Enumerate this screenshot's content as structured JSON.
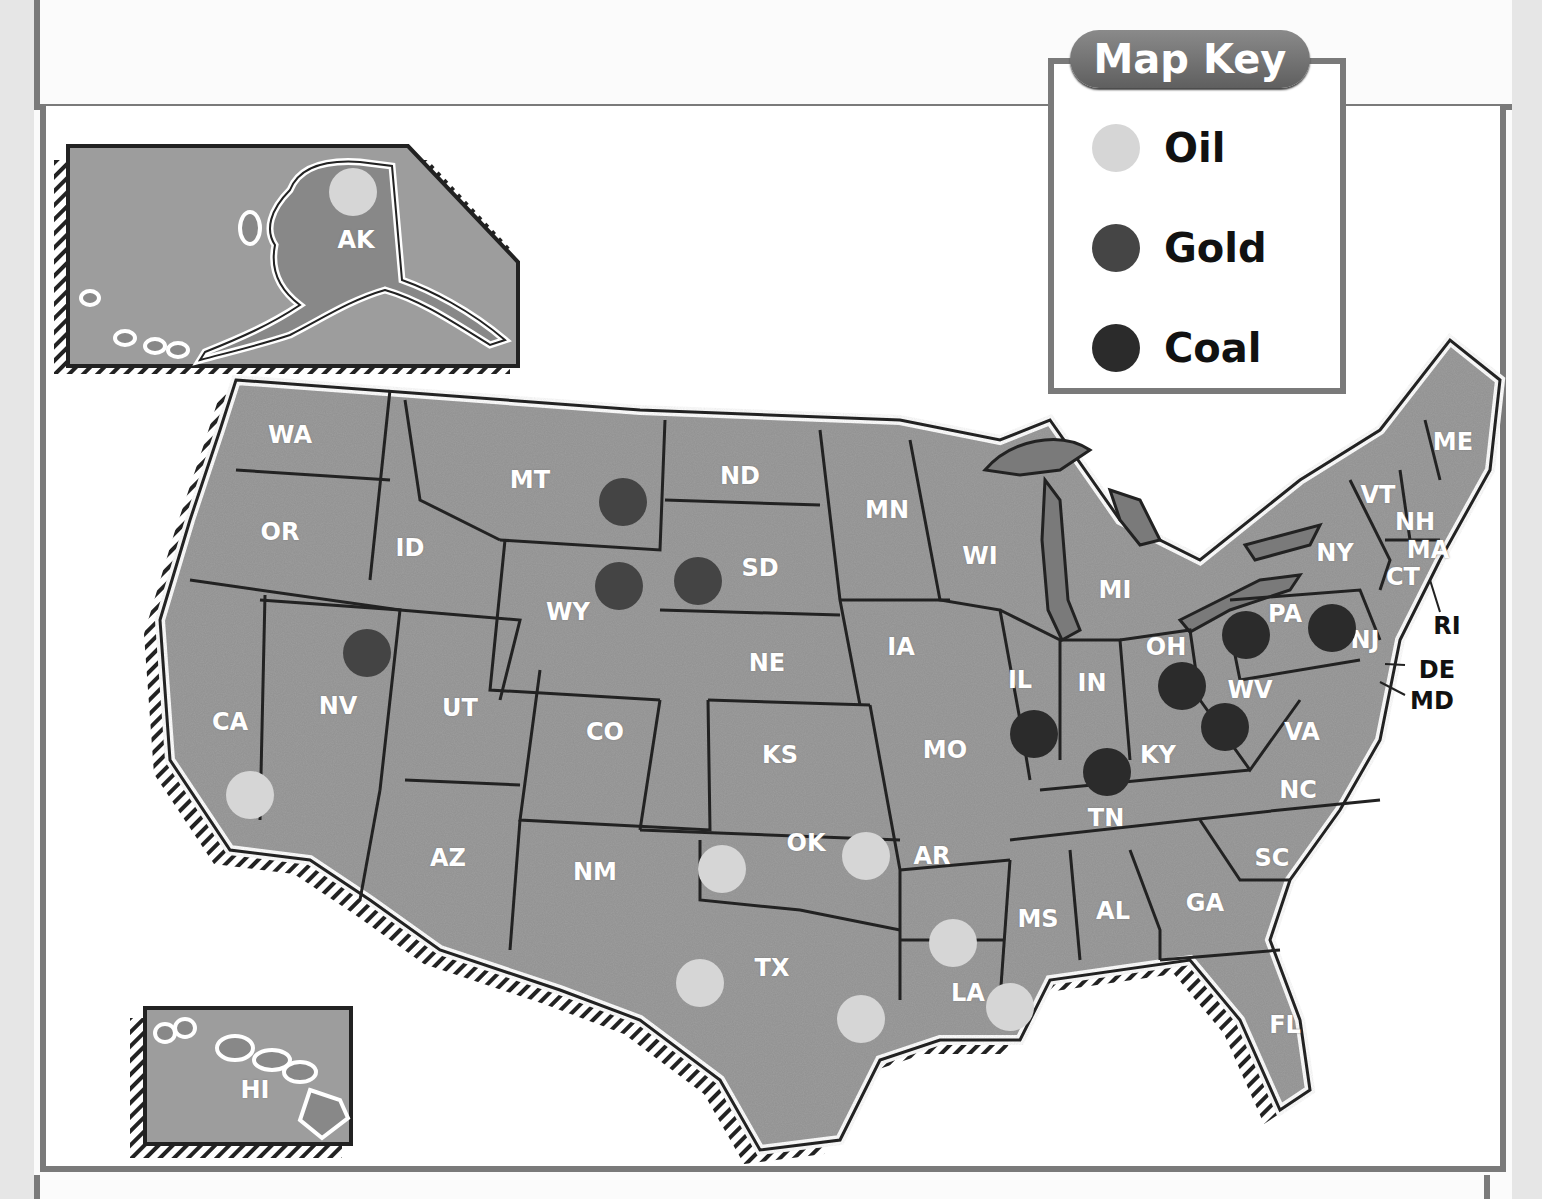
{
  "map": {
    "title": "Map Key",
    "colors": {
      "land": "#9a9a9a",
      "land_dark": "#7f7f7f",
      "border": "#2a2a2a",
      "coast": "#ffffff",
      "water": "#ffffff",
      "frame": "#7a7a7a",
      "oil": "#d6d6d6",
      "gold": "#444444",
      "coal": "#2b2b2b"
    },
    "legend": [
      {
        "id": "oil",
        "label": "Oil",
        "color": "#d6d6d6"
      },
      {
        "id": "gold",
        "label": "Gold",
        "color": "#454545"
      },
      {
        "id": "coal",
        "label": "Coal",
        "color": "#2b2b2b"
      }
    ],
    "states": [
      {
        "abbr": "AK",
        "x": 356,
        "y": 240
      },
      {
        "abbr": "HI",
        "x": 255,
        "y": 1090
      },
      {
        "abbr": "WA",
        "x": 290,
        "y": 435
      },
      {
        "abbr": "OR",
        "x": 280,
        "y": 532
      },
      {
        "abbr": "CA",
        "x": 230,
        "y": 722
      },
      {
        "abbr": "ID",
        "x": 410,
        "y": 548
      },
      {
        "abbr": "NV",
        "x": 338,
        "y": 706
      },
      {
        "abbr": "MT",
        "x": 530,
        "y": 480
      },
      {
        "abbr": "WY",
        "x": 568,
        "y": 612
      },
      {
        "abbr": "UT",
        "x": 460,
        "y": 708
      },
      {
        "abbr": "AZ",
        "x": 448,
        "y": 858
      },
      {
        "abbr": "CO",
        "x": 605,
        "y": 732
      },
      {
        "abbr": "NM",
        "x": 595,
        "y": 872
      },
      {
        "abbr": "ND",
        "x": 740,
        "y": 476
      },
      {
        "abbr": "SD",
        "x": 760,
        "y": 568
      },
      {
        "abbr": "NE",
        "x": 767,
        "y": 663
      },
      {
        "abbr": "KS",
        "x": 780,
        "y": 755
      },
      {
        "abbr": "OK",
        "x": 806,
        "y": 843
      },
      {
        "abbr": "TX",
        "x": 772,
        "y": 968
      },
      {
        "abbr": "MN",
        "x": 887,
        "y": 510
      },
      {
        "abbr": "IA",
        "x": 901,
        "y": 647
      },
      {
        "abbr": "MO",
        "x": 945,
        "y": 750
      },
      {
        "abbr": "AR",
        "x": 932,
        "y": 856
      },
      {
        "abbr": "LA",
        "x": 968,
        "y": 993
      },
      {
        "abbr": "WI",
        "x": 980,
        "y": 556
      },
      {
        "abbr": "IL",
        "x": 1020,
        "y": 680
      },
      {
        "abbr": "MI",
        "x": 1115,
        "y": 590
      },
      {
        "abbr": "IN",
        "x": 1092,
        "y": 683
      },
      {
        "abbr": "OH",
        "x": 1166,
        "y": 647
      },
      {
        "abbr": "KY",
        "x": 1158,
        "y": 755
      },
      {
        "abbr": "TN",
        "x": 1106,
        "y": 818
      },
      {
        "abbr": "MS",
        "x": 1038,
        "y": 919
      },
      {
        "abbr": "AL",
        "x": 1113,
        "y": 911
      },
      {
        "abbr": "GA",
        "x": 1205,
        "y": 903
      },
      {
        "abbr": "FL",
        "x": 1285,
        "y": 1025
      },
      {
        "abbr": "SC",
        "x": 1272,
        "y": 858
      },
      {
        "abbr": "NC",
        "x": 1298,
        "y": 790
      },
      {
        "abbr": "VA",
        "x": 1302,
        "y": 732
      },
      {
        "abbr": "WV",
        "x": 1250,
        "y": 690
      },
      {
        "abbr": "PA",
        "x": 1285,
        "y": 614
      },
      {
        "abbr": "NY",
        "x": 1335,
        "y": 553
      },
      {
        "abbr": "NJ",
        "x": 1365,
        "y": 640
      },
      {
        "abbr": "VT",
        "x": 1378,
        "y": 495
      },
      {
        "abbr": "NH",
        "x": 1415,
        "y": 522
      },
      {
        "abbr": "MA",
        "x": 1428,
        "y": 550
      },
      {
        "abbr": "CT",
        "x": 1403,
        "y": 577
      },
      {
        "abbr": "ME",
        "x": 1453,
        "y": 442
      }
    ],
    "callouts": [
      {
        "abbr": "RI",
        "x": 1447,
        "y": 626
      },
      {
        "abbr": "DE",
        "x": 1437,
        "y": 670
      },
      {
        "abbr": "MD",
        "x": 1432,
        "y": 701
      }
    ],
    "markers": [
      {
        "type": "oil",
        "state": "AK",
        "x": 353,
        "y": 192
      },
      {
        "type": "oil",
        "state": "CA",
        "x": 250,
        "y": 795
      },
      {
        "type": "oil",
        "state": "TX",
        "x": 722,
        "y": 869
      },
      {
        "type": "oil",
        "state": "OK",
        "x": 866,
        "y": 856
      },
      {
        "type": "oil",
        "state": "TX",
        "x": 700,
        "y": 983
      },
      {
        "type": "oil",
        "state": "TX",
        "x": 861,
        "y": 1019
      },
      {
        "type": "oil",
        "state": "LA",
        "x": 953,
        "y": 943
      },
      {
        "type": "oil",
        "state": "LA",
        "x": 1010,
        "y": 1007
      },
      {
        "type": "gold",
        "state": "MT",
        "x": 623,
        "y": 502
      },
      {
        "type": "gold",
        "state": "WY",
        "x": 619,
        "y": 586
      },
      {
        "type": "gold",
        "state": "SD",
        "x": 698,
        "y": 581
      },
      {
        "type": "gold",
        "state": "NV",
        "x": 367,
        "y": 653
      },
      {
        "type": "coal",
        "state": "IL",
        "x": 1034,
        "y": 734
      },
      {
        "type": "coal",
        "state": "KY",
        "x": 1107,
        "y": 772
      },
      {
        "type": "coal",
        "state": "OH",
        "x": 1182,
        "y": 686
      },
      {
        "type": "coal",
        "state": "WV",
        "x": 1225,
        "y": 727
      },
      {
        "type": "coal",
        "state": "PA",
        "x": 1246,
        "y": 635
      },
      {
        "type": "coal",
        "state": "PA",
        "x": 1332,
        "y": 628
      }
    ]
  }
}
